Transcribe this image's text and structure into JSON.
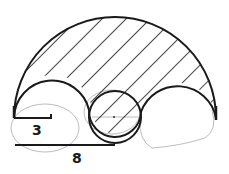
{
  "diagram": {
    "type": "arbelos-shaded-region",
    "labels": {
      "small_radius": "3",
      "large_length": "8"
    },
    "colors": {
      "stroke": "#1a1a1a",
      "sketch": "#b8b8b8",
      "background": "#ffffff"
    }
  }
}
